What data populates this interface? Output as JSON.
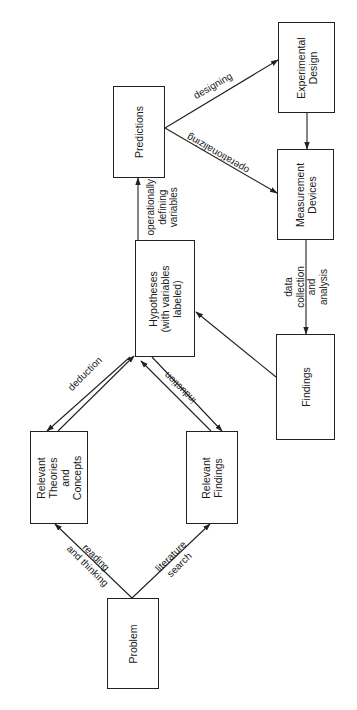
{
  "diagram": {
    "orientation": "rotated 90 degrees counter-clockwise",
    "nodes": [
      {
        "id": "problem",
        "label": "Problem"
      },
      {
        "id": "theories",
        "label": "Relevant\nTheories\nand\nConcepts"
      },
      {
        "id": "rel_findings",
        "label": "Relevant\nFindings"
      },
      {
        "id": "hypotheses",
        "label": "Hypotheses\n(with variables\nlabeled)"
      },
      {
        "id": "predictions",
        "label": "Predictions"
      },
      {
        "id": "exp_design",
        "label": "Experimental\nDesign"
      },
      {
        "id": "measurement",
        "label": "Measurement\nDevices"
      },
      {
        "id": "findings",
        "label": "Findings"
      }
    ],
    "edges": [
      {
        "from": "problem",
        "to": "theories",
        "label": "reading\nand thinking"
      },
      {
        "from": "problem",
        "to": "rel_findings",
        "label": "literature\nsearch"
      },
      {
        "from": "theories",
        "to": "hypotheses",
        "label": "deduction"
      },
      {
        "from": "hypotheses",
        "to": "theories",
        "label": ""
      },
      {
        "from": "rel_findings",
        "to": "hypotheses",
        "label": "induction"
      },
      {
        "from": "hypotheses",
        "to": "rel_findings",
        "label": ""
      },
      {
        "from": "hypotheses",
        "to": "predictions",
        "label": "operationally\ndefining\nvariables"
      },
      {
        "from": "predictions",
        "to": "exp_design",
        "label": "designing"
      },
      {
        "from": "predictions",
        "to": "measurement",
        "label": "operationalizing"
      },
      {
        "from": "exp_design",
        "to": "measurement",
        "label": ""
      },
      {
        "from": "measurement",
        "to": "findings",
        "label": "data\ncollection\nand\nanalysis"
      },
      {
        "from": "findings",
        "to": "hypotheses",
        "label": ""
      }
    ]
  }
}
